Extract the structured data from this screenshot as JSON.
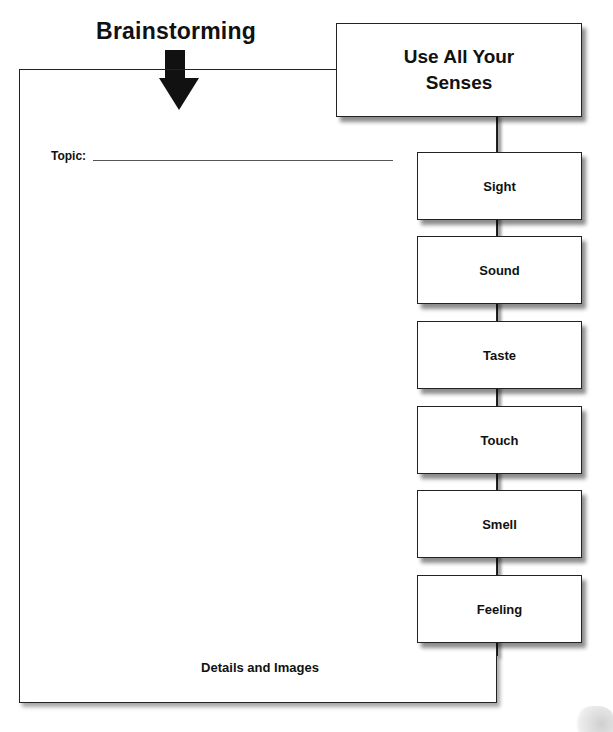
{
  "title": "Brainstorming",
  "main_area": {
    "topic_label": "Topic:",
    "topic_value": "",
    "footer_label": "Details and Images"
  },
  "senses_header": {
    "line1": "Use All Your",
    "line2": "Senses"
  },
  "senses": [
    {
      "label": "Sight",
      "top": 152
    },
    {
      "label": "Sound",
      "top": 236
    },
    {
      "label": "Taste",
      "top": 321
    },
    {
      "label": "Touch",
      "top": 406
    },
    {
      "label": "Smell",
      "top": 490
    },
    {
      "label": "Feeling",
      "top": 575
    }
  ],
  "icons": {
    "arrow": "down-arrow-icon"
  },
  "colors": {
    "ink": "#111111",
    "background": "#ffffff",
    "shadow": "#888888"
  }
}
